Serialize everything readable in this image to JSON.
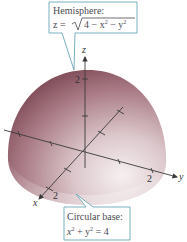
{
  "figure": {
    "type": "3d-surface-diagram",
    "surface": "hemisphere",
    "colors": {
      "surface_dark": "#8e5a66",
      "surface_mid": "#c7a7ae",
      "surface_light": "#f1e9eb",
      "callout_border": "#6aa6b8",
      "callout_fill": "#ffffff",
      "axis": "#3a3a3a"
    }
  },
  "callouts": {
    "top": {
      "title": "Hemisphere:",
      "equation_lhs": "z = ",
      "equation_rad": "4 − x",
      "equation_mid": " − y",
      "exp1": "2",
      "exp2": "2"
    },
    "bottom": {
      "title": "Circular base:",
      "eq_x": "x",
      "eq_plus": " + y",
      "eq_end": " = 4",
      "exp1": "2",
      "exp2": "2"
    }
  },
  "axes": {
    "x": {
      "label": "x",
      "tick_label": "2"
    },
    "y": {
      "label": "y",
      "tick_label": "2"
    },
    "z": {
      "label": "z",
      "tick_label": "2"
    }
  }
}
